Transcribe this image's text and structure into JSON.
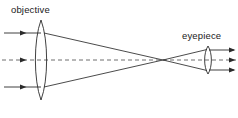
{
  "figure": {
    "kind": "optical-ray-diagram",
    "background_color": "#ffffff",
    "ink_color": "#2b2b2b",
    "width": 238,
    "height": 118
  },
  "labels": {
    "objective": "objective",
    "eyepiece": "eyepiece"
  },
  "label_positions": {
    "objective": {
      "x": 11,
      "y": 13
    },
    "eyepiece": {
      "x": 182,
      "y": 39
    }
  },
  "optical_axis": {
    "name": "optical-axis",
    "y": 60,
    "x_start": 2,
    "x_end": 236,
    "style": "dashed",
    "dash_pattern": "4 3"
  },
  "lenses": [
    {
      "id": "objective-lens",
      "label": "objective",
      "center_x": 41,
      "center_y": 60,
      "top_y": 20,
      "bottom_y": 100,
      "half_width": 7,
      "shape": "biconvex"
    },
    {
      "id": "eyepiece-lens",
      "label": "eyepiece",
      "center_x": 208,
      "center_y": 60,
      "top_y": 46,
      "bottom_y": 74,
      "half_width": 4,
      "shape": "biconvex"
    }
  ],
  "focal_point": {
    "name": "intermediate-image-focus",
    "x": 163,
    "y": 60
  },
  "incoming_rays": [
    {
      "id": "incoming-ray-upper",
      "x_start": 4,
      "x_end": 41,
      "y": 33,
      "arrow_at": 26
    },
    {
      "id": "incoming-ray-axis",
      "x_start": 4,
      "x_end": 41,
      "y": 60,
      "arrow_at": 26,
      "style": "dashed"
    },
    {
      "id": "incoming-ray-lower",
      "x_start": 4,
      "x_end": 41,
      "y": 87,
      "arrow_at": 26
    }
  ],
  "converging_rays": [
    {
      "id": "converging-ray-upper",
      "x1": 44,
      "y1": 33,
      "x2": 163,
      "y2": 60
    },
    {
      "id": "converging-ray-lower",
      "x1": 44,
      "y1": 87,
      "x2": 163,
      "y2": 60
    }
  ],
  "diverging_rays": [
    {
      "id": "diverging-ray-upper",
      "x1": 163,
      "y1": 60,
      "x2": 206,
      "y2": 50
    },
    {
      "id": "diverging-ray-lower",
      "x1": 163,
      "y1": 60,
      "x2": 206,
      "y2": 70
    }
  ],
  "outgoing_rays": [
    {
      "id": "outgoing-ray-upper",
      "x_start": 209,
      "x_end": 235,
      "y": 50,
      "arrow_at": 235
    },
    {
      "id": "outgoing-ray-axis",
      "x_start": 209,
      "x_end": 235,
      "y": 60,
      "arrow_at": 235,
      "style": "dashed"
    },
    {
      "id": "outgoing-ray-lower",
      "x_start": 209,
      "x_end": 235,
      "y": 70,
      "arrow_at": 235
    }
  ]
}
